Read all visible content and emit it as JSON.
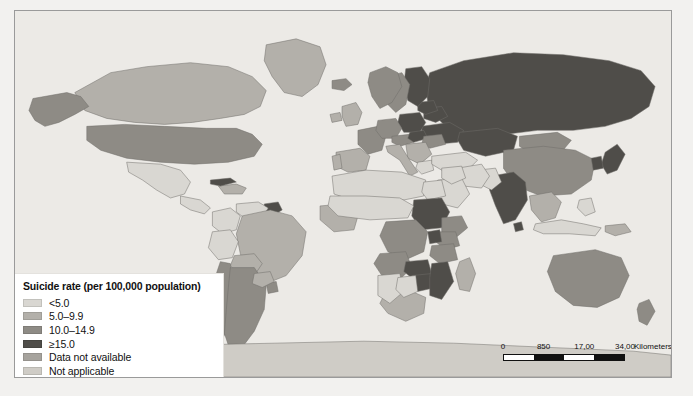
{
  "figure": {
    "name": "world-suicide-rate-choropleth"
  },
  "legend": {
    "title": "Suicide rate (per 100,000 population)",
    "items": [
      {
        "label": "<5.0",
        "color": "#d9d7d2"
      },
      {
        "label": "5.0–9.9",
        "color": "#b3b0aa"
      },
      {
        "label": "10.0–14.9",
        "color": "#8e8b85"
      },
      {
        "label": "≥15.0",
        "color": "#4f4d49"
      },
      {
        "label": "Data not available",
        "color": "#a6a39d"
      },
      {
        "label": "Not applicable",
        "color": "#cfccc6"
      }
    ]
  },
  "scalebar": {
    "ticks": [
      "0",
      "850",
      "17,00",
      "34,00"
    ],
    "units": "Kilometers"
  },
  "chart_data": {
    "type": "map",
    "title": "Suicide rate (per 100,000 population)",
    "projection": "equirectangular-world",
    "classes": [
      {
        "id": "c1",
        "label": "<5.0",
        "color": "#d9d7d2"
      },
      {
        "id": "c2",
        "label": "5.0–9.9",
        "color": "#b3b0aa"
      },
      {
        "id": "c3",
        "label": "10.0–14.9",
        "color": "#8e8b85"
      },
      {
        "id": "c4",
        "label": "≥15.0",
        "color": "#4f4d49"
      },
      {
        "id": "c5",
        "label": "Data not available",
        "color": "#a6a39d"
      },
      {
        "id": "c6",
        "label": "Not applicable",
        "color": "#cfccc6"
      }
    ],
    "ocean_color": "#eceae6",
    "border_color": "#6f6d69",
    "regions": [
      {
        "name": "Canada",
        "class": "c2"
      },
      {
        "name": "United States",
        "class": "c3"
      },
      {
        "name": "Alaska",
        "class": "c3"
      },
      {
        "name": "Greenland",
        "class": "c2"
      },
      {
        "name": "Mexico",
        "class": "c1"
      },
      {
        "name": "Central America",
        "class": "c1"
      },
      {
        "name": "Caribbean",
        "class": "c2"
      },
      {
        "name": "Cuba",
        "class": "c4"
      },
      {
        "name": "Guyana",
        "class": "c4"
      },
      {
        "name": "Venezuela",
        "class": "c1"
      },
      {
        "name": "Colombia",
        "class": "c1"
      },
      {
        "name": "Brazil",
        "class": "c2"
      },
      {
        "name": "Peru",
        "class": "c1"
      },
      {
        "name": "Bolivia",
        "class": "c2"
      },
      {
        "name": "Chile",
        "class": "c3"
      },
      {
        "name": "Argentina",
        "class": "c3"
      },
      {
        "name": "Uruguay",
        "class": "c3"
      },
      {
        "name": "Paraguay",
        "class": "c2"
      },
      {
        "name": "Russia",
        "class": "c4"
      },
      {
        "name": "Ukraine",
        "class": "c4"
      },
      {
        "name": "Belarus",
        "class": "c4"
      },
      {
        "name": "Poland",
        "class": "c4"
      },
      {
        "name": "Baltics",
        "class": "c4"
      },
      {
        "name": "Finland",
        "class": "c4"
      },
      {
        "name": "Sweden",
        "class": "c3"
      },
      {
        "name": "Norway",
        "class": "c3"
      },
      {
        "name": "United Kingdom",
        "class": "c2"
      },
      {
        "name": "Ireland",
        "class": "c2"
      },
      {
        "name": "France",
        "class": "c3"
      },
      {
        "name": "Spain",
        "class": "c2"
      },
      {
        "name": "Portugal",
        "class": "c2"
      },
      {
        "name": "Germany",
        "class": "c3"
      },
      {
        "name": "Austria",
        "class": "c3"
      },
      {
        "name": "Hungary",
        "class": "c4"
      },
      {
        "name": "Romania",
        "class": "c3"
      },
      {
        "name": "Balkans",
        "class": "c2"
      },
      {
        "name": "Italy",
        "class": "c2"
      },
      {
        "name": "Greece",
        "class": "c1"
      },
      {
        "name": "Turkey",
        "class": "c1"
      },
      {
        "name": "Iceland",
        "class": "c3"
      },
      {
        "name": "Kazakhstan",
        "class": "c4"
      },
      {
        "name": "Mongolia",
        "class": "c3"
      },
      {
        "name": "China",
        "class": "c3"
      },
      {
        "name": "Japan",
        "class": "c4"
      },
      {
        "name": "Korea",
        "class": "c4"
      },
      {
        "name": "India",
        "class": "c4"
      },
      {
        "name": "Sri Lanka",
        "class": "c4"
      },
      {
        "name": "Pakistan",
        "class": "c1"
      },
      {
        "name": "Iran",
        "class": "c1"
      },
      {
        "name": "Saudi Arabia",
        "class": "c1"
      },
      {
        "name": "Middle East",
        "class": "c1"
      },
      {
        "name": "Southeast Asia",
        "class": "c2"
      },
      {
        "name": "Indonesia",
        "class": "c1"
      },
      {
        "name": "Philippines",
        "class": "c1"
      },
      {
        "name": "Australia",
        "class": "c3"
      },
      {
        "name": "New Zealand",
        "class": "c3"
      },
      {
        "name": "Papua New Guinea",
        "class": "c2"
      },
      {
        "name": "North Africa",
        "class": "c1"
      },
      {
        "name": "Egypt",
        "class": "c1"
      },
      {
        "name": "Sudan",
        "class": "c4"
      },
      {
        "name": "Ethiopia",
        "class": "c3"
      },
      {
        "name": "Kenya",
        "class": "c3"
      },
      {
        "name": "Tanzania",
        "class": "c3"
      },
      {
        "name": "Uganda",
        "class": "c4"
      },
      {
        "name": "DR Congo",
        "class": "c3"
      },
      {
        "name": "Angola",
        "class": "c3"
      },
      {
        "name": "Zambia",
        "class": "c4"
      },
      {
        "name": "Zimbabwe",
        "class": "c4"
      },
      {
        "name": "Mozambique",
        "class": "c4"
      },
      {
        "name": "South Africa",
        "class": "c2"
      },
      {
        "name": "Namibia",
        "class": "c1"
      },
      {
        "name": "Botswana",
        "class": "c1"
      },
      {
        "name": "Madagascar",
        "class": "c2"
      },
      {
        "name": "West Africa",
        "class": "c2"
      },
      {
        "name": "Sahel",
        "class": "c1"
      },
      {
        "name": "Antarctica",
        "class": "c6"
      }
    ]
  }
}
